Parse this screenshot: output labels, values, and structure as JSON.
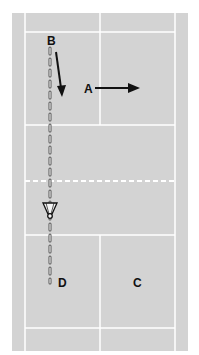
{
  "diagram": {
    "type": "badminton-court-doubles",
    "colors": {
      "court": "#d3d3d3",
      "lines": "#ffffff",
      "marks": "#111111",
      "background": "#ffffff"
    },
    "players": [
      {
        "id": "B",
        "label": "B",
        "movement": "backward-diagonal (down)"
      },
      {
        "id": "A",
        "label": "A",
        "movement": "sideways (right)"
      },
      {
        "id": "D",
        "label": "D"
      },
      {
        "id": "C",
        "label": "C"
      }
    ],
    "shuttle_path": {
      "style": "dashed",
      "description": "straight shot from B's side across the net toward D"
    },
    "net": {
      "style": "dashed"
    }
  }
}
